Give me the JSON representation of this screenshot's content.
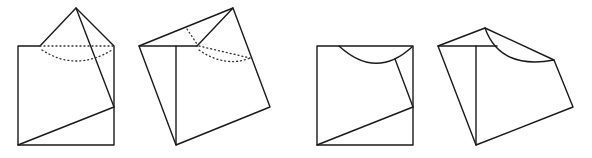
{
  "diagram": {
    "figures": [
      {
        "id": "fig1",
        "label": "folded square with pyramid flap and dotted hidden arc"
      },
      {
        "id": "fig2",
        "label": "rotated view of folded square with dotted hidden arc"
      },
      {
        "id": "fig3",
        "label": "square with curved arc cut at top"
      },
      {
        "id": "fig4",
        "label": "rotated view of square with curved arc edge"
      }
    ],
    "colors": {
      "stroke": "#1a1a1a",
      "background": "#ffffff"
    }
  }
}
